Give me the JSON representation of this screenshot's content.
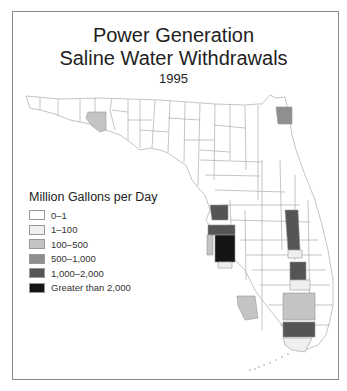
{
  "title": {
    "line1": "Power Generation",
    "line2": "Saline Water Withdrawals",
    "year": "1995"
  },
  "legend": {
    "title": "Million Gallons per Day",
    "items": [
      {
        "label": "0–1",
        "color": "#ffffff"
      },
      {
        "label": "1–100",
        "color": "#efefef"
      },
      {
        "label": "100–500",
        "color": "#c4c4c4"
      },
      {
        "label": "500–1,000",
        "color": "#8f8f8f"
      },
      {
        "label": "1,000–2,000",
        "color": "#555555"
      },
      {
        "label": "Greater than 2,000",
        "color": "#151515"
      }
    ]
  },
  "colors": {
    "border": "#8a8a8a",
    "county_line": "#b5b5b5"
  }
}
